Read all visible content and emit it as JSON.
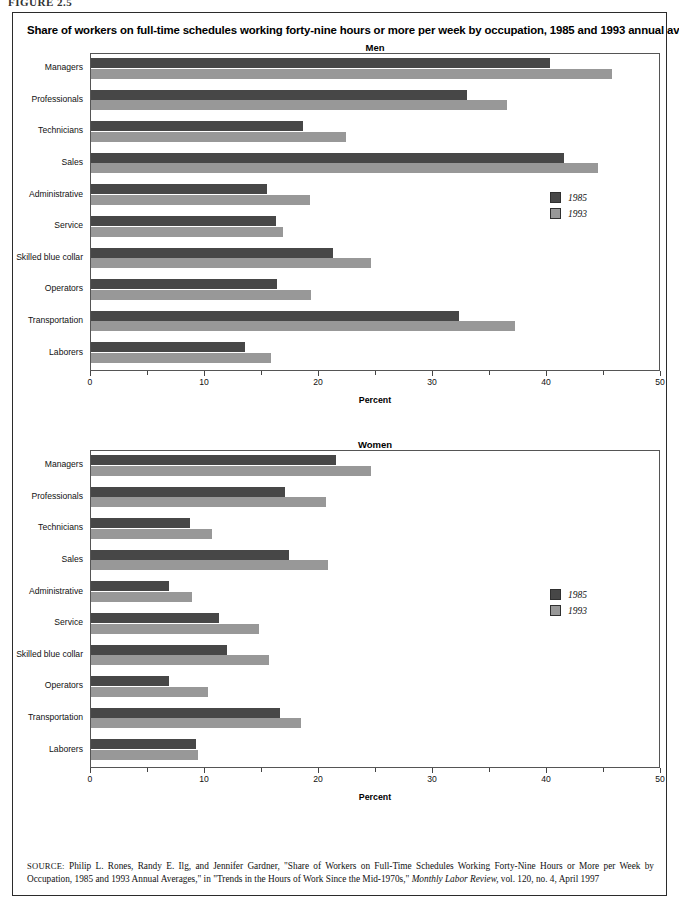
{
  "figure_tag": "FIGURE 2.5",
  "title": "Share of workers on full-time schedules working forty-nine hours or more per week by occupation, 1985 and 1993 annual averages",
  "axis": {
    "x_title": "Percent",
    "x_min": 0,
    "x_max": 50,
    "x_ticks_major": [
      0,
      10,
      20,
      30,
      40,
      50
    ],
    "x_ticks_minor": [
      5,
      15,
      25,
      35,
      45
    ],
    "x_tick_labels": [
      "0",
      "10",
      "20",
      "30",
      "40",
      "50"
    ]
  },
  "legend": {
    "entries": [
      {
        "label": "1985",
        "color": "#474747"
      },
      {
        "label": "1993",
        "color": "#989898"
      }
    ]
  },
  "source": {
    "prefix": "SOURCE:",
    "text": " Philip L. Rones, Randy E. Ilg, and Jennifer Gardner, \"Share of Workers on Full-Time Schedules Working Forty-Nine Hours or More per Week by Occupation, 1985 and 1993 Annual Averages,\" in \"Trends in the Hours of Work Since the Mid-1970s,\" ",
    "italic": "Monthly Labor Review,",
    "suffix": " vol. 120, no. 4, April 1997"
  },
  "chart_data": [
    {
      "type": "bar",
      "orientation": "horizontal",
      "title": "Men",
      "xlabel": "Percent",
      "ylabel": "",
      "xlim": [
        0,
        50
      ],
      "grid": false,
      "legend_position": "right-middle",
      "categories": [
        "Managers",
        "Professionals",
        "Technicians",
        "Sales",
        "Administrative",
        "Service",
        "Skilled blue collar",
        "Operators",
        "Transportation",
        "Laborers"
      ],
      "series": [
        {
          "name": "1985",
          "color": "#474747",
          "values": [
            40.3,
            33.0,
            18.6,
            41.5,
            15.4,
            16.2,
            21.2,
            16.3,
            32.3,
            13.5
          ]
        },
        {
          "name": "1993",
          "color": "#989898",
          "values": [
            45.7,
            36.5,
            22.4,
            44.5,
            19.2,
            16.8,
            24.6,
            19.3,
            37.2,
            15.8
          ]
        }
      ]
    },
    {
      "type": "bar",
      "orientation": "horizontal",
      "title": "Women",
      "xlabel": "Percent",
      "ylabel": "",
      "xlim": [
        0,
        50
      ],
      "grid": false,
      "legend_position": "right-middle",
      "categories": [
        "Managers",
        "Professionals",
        "Technicians",
        "Sales",
        "Administrative",
        "Service",
        "Skilled blue collar",
        "Operators",
        "Transportation",
        "Laborers"
      ],
      "series": [
        {
          "name": "1985",
          "color": "#474747",
          "values": [
            21.5,
            17.0,
            8.7,
            17.4,
            6.8,
            11.2,
            11.9,
            6.8,
            16.6,
            9.2
          ]
        },
        {
          "name": "1993",
          "color": "#989898",
          "values": [
            24.6,
            20.6,
            10.6,
            20.8,
            8.9,
            14.7,
            15.6,
            10.3,
            18.4,
            9.4
          ]
        }
      ]
    }
  ]
}
